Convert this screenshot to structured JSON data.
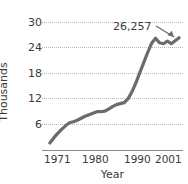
{
  "chart_data": {
    "type": "line",
    "title": "",
    "xlabel": "Year",
    "ylabel": "Thousands",
    "xlim": [
      1969,
      2005
    ],
    "ylim": [
      4,
      31
    ],
    "grid": true,
    "legend": false,
    "line_color": "#6b6b6b",
    "y_ticks": [
      6,
      12,
      18,
      24,
      30
    ],
    "y_tick_labels": [
      "6",
      "12",
      "18",
      "24",
      "30"
    ],
    "x_ticks": [
      1971,
      1980,
      1990,
      2001
    ],
    "x_tick_labels": [
      "1971",
      "1980",
      "1990",
      "2001"
    ],
    "annotations": [
      {
        "text": "26,257",
        "x": 2004,
        "y": 26.257
      }
    ],
    "x": [
      1971,
      1972,
      1973,
      1974,
      1975,
      1976,
      1977,
      1978,
      1979,
      1980,
      1981,
      1982,
      1983,
      1984,
      1985,
      1986,
      1987,
      1988,
      1989,
      1990,
      1991,
      1992,
      1993,
      1994,
      1995,
      1996,
      1997,
      1998,
      1999,
      2000,
      2001,
      2002,
      2003,
      2004
    ],
    "values": [
      5.4,
      6.4,
      7.3,
      8.1,
      8.8,
      9.4,
      9.6,
      9.9,
      10.3,
      10.7,
      11.0,
      11.3,
      11.6,
      11.6,
      11.7,
      12.1,
      12.6,
      13.0,
      13.2,
      13.4,
      14.2,
      15.6,
      17.4,
      19.4,
      21.4,
      23.4,
      25.2,
      26.2,
      25.3,
      25.1,
      25.6,
      25.1,
      25.7,
      26.3
    ]
  },
  "axis": {
    "y_title": "Thousands",
    "x_title": "Year"
  }
}
